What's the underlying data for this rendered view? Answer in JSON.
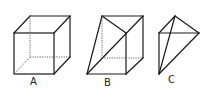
{
  "figures": [
    {
      "id": "A",
      "label": "A",
      "description": "Cube with hidden edges dashed"
    },
    {
      "id": "B",
      "label": "B",
      "description": "Cube cut by a diagonal plane forming a prism with diagonals"
    },
    {
      "id": "C",
      "label": "C",
      "description": "Tetrahedron"
    }
  ],
  "colors": {
    "stroke": "#1a1a1a",
    "hidden_stroke": "#555555",
    "background": "#ffffff"
  }
}
